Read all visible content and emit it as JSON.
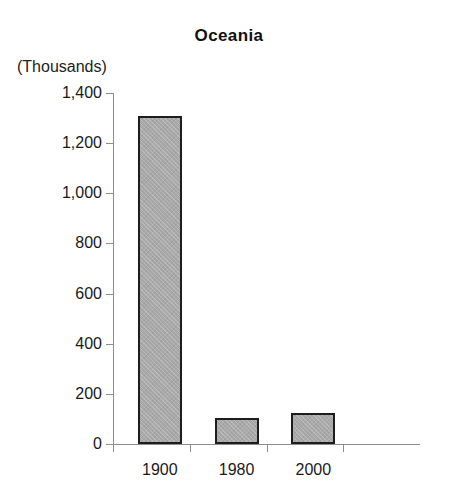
{
  "chart_data": {
    "type": "bar",
    "title": "Oceania",
    "subtitle": "",
    "xlabel": "",
    "ylabel": "(Thousands)",
    "categories": [
      "1900",
      "1980",
      "2000"
    ],
    "values": [
      1310,
      105,
      125
    ],
    "series": [
      {
        "name": "Oceania",
        "values": [
          1310,
          105,
          125
        ]
      }
    ],
    "ylim": [
      0,
      1400
    ],
    "ytick_values": [
      0,
      200,
      400,
      600,
      800,
      1000,
      1200,
      1400
    ],
    "ytick_labels": [
      "0",
      "200",
      "400",
      "600",
      "800",
      "1,000",
      "1,200",
      "1,400"
    ],
    "grid": false,
    "legend": false,
    "legend_position": "none",
    "bar_fill_color": "#a9a9a9",
    "bar_border_color": "#1d1d1d",
    "axis_color": "#8d8d8d",
    "text_color": "#1a1a1a",
    "background_color": "#ffffff"
  }
}
